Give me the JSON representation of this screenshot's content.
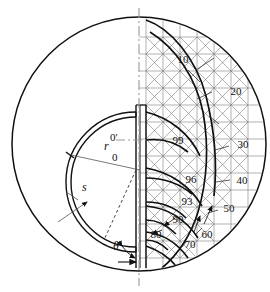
{
  "figure": {
    "name": "cross-section-contour-diagram",
    "geometry": {
      "outer_circle": {
        "cx": 139,
        "cy": 144,
        "r": 127
      },
      "inner_annulus": {
        "cx": 136,
        "cy": 182,
        "r_outer": 70,
        "thickness_s": 5
      },
      "centerline_x": 139,
      "slot_band": {
        "x_left": 136,
        "x_right": 146,
        "y_top": 104,
        "y_bottom": 268
      }
    },
    "symbols": {
      "center_outer": "0",
      "center_inner": "0'",
      "radius_label": "r",
      "thickness_label": "s",
      "angle_label": "θ"
    },
    "contour_labels": [
      {
        "value": "10",
        "x": 183,
        "y": 63
      },
      {
        "value": "20",
        "x": 236,
        "y": 95
      },
      {
        "value": "30",
        "x": 243,
        "y": 148
      },
      {
        "value": "40",
        "x": 242,
        "y": 184
      },
      {
        "value": "50",
        "x": 229,
        "y": 212
      },
      {
        "value": "60",
        "x": 207,
        "y": 238
      },
      {
        "value": "70",
        "x": 190,
        "y": 248
      },
      {
        "value": "80",
        "x": 156,
        "y": 238
      },
      {
        "value": "90",
        "x": 178,
        "y": 223
      },
      {
        "value": "93",
        "x": 187,
        "y": 205
      },
      {
        "value": "96",
        "x": 191,
        "y": 183
      },
      {
        "value": "99",
        "x": 178,
        "y": 144
      }
    ],
    "colors": {
      "line_dark": "#111111",
      "grid_gray": "#8a8a8a",
      "centerline": "#9a9a9a",
      "background": "#ffffff"
    }
  }
}
